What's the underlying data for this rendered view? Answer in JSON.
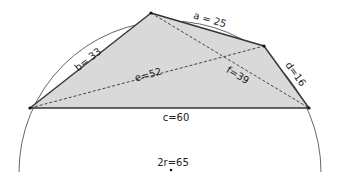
{
  "diagram": {
    "type": "cyclic-quadrilateral",
    "colors": {
      "fill": "#d9d9d9",
      "edge": "#333333",
      "circle": "#666666",
      "diagonal": "#444444",
      "background": "#ffffff"
    },
    "labels": {
      "a": "a = 25",
      "b": "b= 33",
      "c": "c=60",
      "d": "d=16",
      "e": "e=52",
      "f": "f=39",
      "diameter": "2r=65"
    },
    "values": {
      "a": 25,
      "b": 33,
      "c": 60,
      "d": 16,
      "e": 52,
      "f": 39,
      "2r": 65
    }
  }
}
